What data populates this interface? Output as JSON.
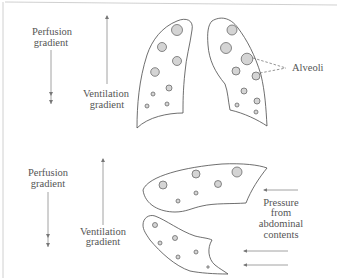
{
  "upright": {
    "perfusion_label": [
      "Perfusion",
      "gradient"
    ],
    "ventilation_label": [
      "Ventilation",
      "gradient"
    ],
    "alveoli_label": "Alveoli",
    "left_lung_alveoli": [
      [
        177,
        30,
        5.5
      ],
      [
        162,
        47,
        4.5
      ],
      [
        177,
        61,
        4.5
      ],
      [
        155,
        72,
        4.3
      ],
      [
        169,
        88,
        3
      ],
      [
        153,
        94,
        2
      ],
      [
        167,
        104,
        2
      ],
      [
        147,
        106,
        2
      ]
    ],
    "right_lung_alveoli": [
      [
        232,
        30,
        5
      ],
      [
        226,
        48,
        5.5
      ],
      [
        247,
        59,
        5.8
      ],
      [
        236,
        71,
        4
      ],
      [
        256,
        76,
        4
      ],
      [
        244,
        91,
        3
      ],
      [
        257,
        101,
        3
      ],
      [
        237,
        105,
        2
      ],
      [
        256,
        112,
        2
      ]
    ]
  },
  "supine": {
    "perfusion_label": [
      "Perfusion",
      "gradient"
    ],
    "ventilation_label": [
      "Ventilation",
      "gradient"
    ],
    "pressure_label": [
      "Pressure",
      "from",
      "abdominal",
      "contents"
    ],
    "upper_lung_alveoli": [
      [
        163,
        185,
        4
      ],
      [
        196,
        174,
        4
      ],
      [
        237,
        172,
        5
      ],
      [
        218,
        184,
        3.5
      ],
      [
        196,
        193,
        2
      ],
      [
        178,
        201,
        2
      ]
    ],
    "lower_lung_alveoli": [
      [
        155,
        225,
        2.5
      ],
      [
        175,
        238,
        2.5
      ],
      [
        160,
        243,
        2
      ],
      [
        196,
        252,
        2
      ],
      [
        178,
        257,
        2
      ],
      [
        208,
        267,
        1.2
      ]
    ]
  },
  "colors": {
    "outline": "#4a4a4a",
    "alveolus_fill": "#d4d4d4",
    "arrow": "#8a8a8a",
    "text": "#555555"
  }
}
